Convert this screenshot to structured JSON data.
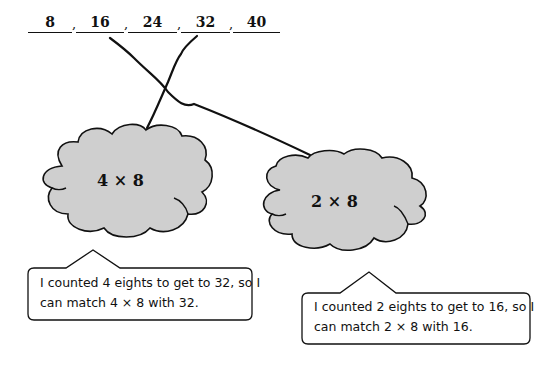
{
  "sequence": {
    "items": [
      "8",
      "16",
      "24",
      "32",
      "40"
    ],
    "separator": ","
  },
  "clouds": [
    {
      "id": "left",
      "label": "4 × 8",
      "fill": "#cfcfcf",
      "matches": "32"
    },
    {
      "id": "right",
      "label": "2 × 8",
      "fill": "#cfcfcf",
      "matches": "16"
    }
  ],
  "callouts": [
    {
      "id": "left",
      "line1": "I counted 4 eights to get to 32, so I",
      "line2": "can match 4 × 8 with 32."
    },
    {
      "id": "right",
      "line1": "I counted 2 eights to get to 16, so I",
      "line2": "can match 2 × 8 with 16."
    }
  ],
  "colors": {
    "stroke": "#111111",
    "cloud_fill": "#cfcfcf",
    "background": "#ffffff"
  }
}
